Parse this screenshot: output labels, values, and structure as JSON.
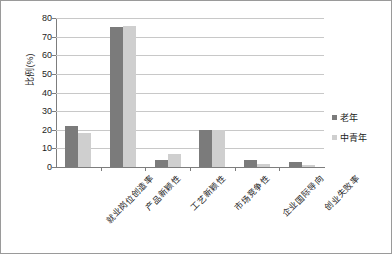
{
  "chart_data": {
    "type": "bar",
    "title": "",
    "subtitle": "",
    "xlabel": "",
    "ylabel": "比例(%)",
    "ylim": [
      0,
      80
    ],
    "ytick_step": 10,
    "yticks": [
      "0",
      "10",
      "20",
      "30",
      "40",
      "50",
      "60",
      "70",
      "80"
    ],
    "grid": true,
    "legend_position": "right",
    "categories": [
      "就业岗位创造率",
      "产品新颖性",
      "工艺新颖性",
      "市场竞争性",
      "企业国际导向",
      "创业失败率"
    ],
    "series": [
      {
        "name": "老年",
        "color": "#7b7b7b",
        "values": [
          22,
          75,
          4,
          20,
          4,
          2.5
        ]
      },
      {
        "name": "中青年",
        "color": "#cfcfcf",
        "values": [
          18.5,
          75.5,
          7,
          20,
          1.5,
          1
        ]
      }
    ]
  },
  "legend": {
    "items": [
      {
        "label": "老年"
      },
      {
        "label": "中青年"
      }
    ]
  },
  "colors": {
    "series_old": "#7b7b7b",
    "series_young": "#cfcfcf",
    "axis": "#7d7d7d",
    "grid": "#c8c8c8",
    "border": "#9a9a9a",
    "text": "#1c1c1c"
  }
}
